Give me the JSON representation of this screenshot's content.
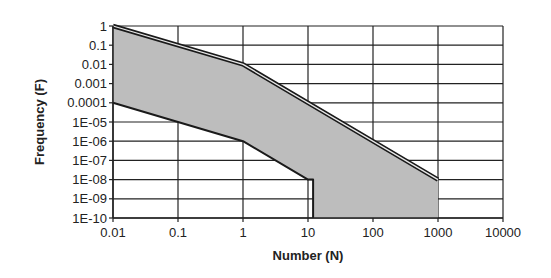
{
  "chart_data": {
    "type": "area",
    "title": "",
    "xlabel": "Number (N)",
    "ylabel": "Frequency (F)",
    "xscale": "log",
    "yscale": "log",
    "xlim": [
      0.01,
      10000
    ],
    "ylim": [
      1e-10,
      1
    ],
    "grid": true,
    "legend": "none",
    "x_tick_labels": [
      "0.01",
      "0.1",
      "1",
      "10",
      "100",
      "1000",
      "10000"
    ],
    "x_ticks": [
      0.01,
      0.1,
      1,
      10,
      100,
      1000,
      10000
    ],
    "y_tick_labels": [
      "1",
      "0.1",
      "0.01",
      "0.001",
      "0.0001",
      "1E-05",
      "1E-06",
      "1E-07",
      "1E-08",
      "1E-09",
      "1E-10"
    ],
    "y_ticks": [
      1,
      0.1,
      0.01,
      0.001,
      0.0001,
      1e-05,
      1e-06,
      1e-07,
      1e-08,
      1e-09,
      1e-10
    ],
    "series": [
      {
        "name": "Upper bound",
        "style": "double-line",
        "points": [
          [
            0.01,
            1
          ],
          [
            1,
            0.01
          ],
          [
            1000,
            1e-08
          ]
        ]
      },
      {
        "name": "Lower bound",
        "style": "line",
        "points": [
          [
            0.01,
            0.0001
          ],
          [
            1,
            1e-06
          ],
          [
            10,
            1e-08
          ],
          [
            12,
            1e-08
          ],
          [
            12,
            1e-10
          ]
        ]
      }
    ],
    "shaded_region": {
      "name": "Region between bounds",
      "color": "#bdbdbd",
      "outline": [
        [
          0.01,
          1
        ],
        [
          1,
          0.01
        ],
        [
          1000,
          1e-08
        ],
        [
          1000,
          1e-10
        ],
        [
          12,
          1e-10
        ],
        [
          12,
          1e-08
        ],
        [
          10,
          1e-08
        ],
        [
          1,
          1e-06
        ],
        [
          0.01,
          0.0001
        ]
      ]
    },
    "colors": {
      "line": "#1a1a1a",
      "grid": "#222222",
      "fill": "#bdbdbd"
    }
  }
}
